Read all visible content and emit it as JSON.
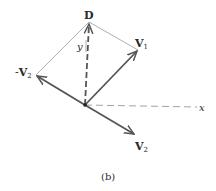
{
  "figure": {
    "caption": "(b)",
    "labels": {
      "D": "D",
      "V1_main": "V",
      "V1_sub": "1",
      "negV2_prefix": "-",
      "negV2_main": "V",
      "negV2_sub": "2",
      "V2_main": "V",
      "V2_sub": "2",
      "x_axis": "x",
      "y_axis": "y"
    },
    "colors": {
      "vector": "#555555",
      "thin_line": "#9a9a9a",
      "axis_dash": "#8a8a8a",
      "text": "#2a2a2a"
    },
    "geometry": {
      "origin": [
        85,
        105
      ],
      "D": [
        89,
        22
      ],
      "V1": [
        138,
        50
      ],
      "negV2": [
        36,
        75
      ],
      "V2": [
        135,
        135
      ],
      "x_axis_end": [
        197,
        107
      ]
    }
  }
}
